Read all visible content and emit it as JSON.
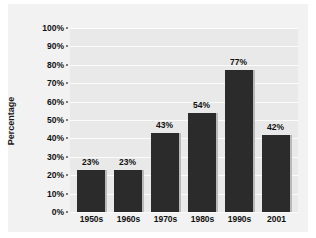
{
  "chart_data": {
    "type": "bar",
    "title": "",
    "xlabel": "",
    "ylabel": "Percentage",
    "categories": [
      "1950s",
      "1960s",
      "1970s",
      "1980s",
      "1990s",
      "2001"
    ],
    "values": [
      23,
      23,
      43,
      54,
      77,
      42
    ],
    "value_labels": [
      "23%",
      "23%",
      "43%",
      "54%",
      "77%",
      "42%"
    ],
    "ylim": [
      0,
      100
    ],
    "ytick_labels": [
      "100%",
      "90%",
      "80%",
      "70%",
      "60%",
      "50%",
      "40%",
      "30%",
      "20%",
      "10%",
      "0%"
    ],
    "ytick_values": [
      100,
      90,
      80,
      70,
      60,
      50,
      40,
      30,
      20,
      10,
      0
    ],
    "grid": true,
    "legend": "none",
    "colors": {
      "bar": "#2b2b2b",
      "bar_edge": "#b9b9b9",
      "plot_background": "#e9e9e9",
      "panel_background": "#f2f2f2",
      "gridline": "#fbfbfb",
      "text": "#111111"
    }
  }
}
